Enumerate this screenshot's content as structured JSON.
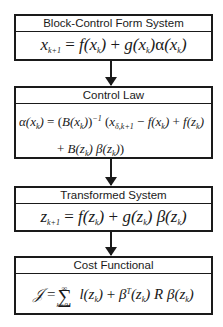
{
  "diagram": {
    "blocks": [
      {
        "title": "Block-Control Form System",
        "equation": {
          "lhs": "x",
          "lhs_sub": "k+1",
          "text": "= f(x_k) + g(x_k) α(x_k)"
        }
      },
      {
        "title": "Control Law",
        "equation": {
          "line1": "α(x_k) = (B(x_k))^{-1} (x_{δ,k+1} − f(x_k) + f(z_k)",
          "line2": "+ B(z_k) β(z_k))"
        }
      },
      {
        "title": "Transformed System",
        "equation": {
          "text": "z_{k+1} = f(z_k) + g(z_k) β(z_k)"
        }
      },
      {
        "title": "Cost Functional",
        "equation": {
          "text": "J = Σ_{k=0}^{∞} l(z_k) + β^T(z_k) R β(z_k)",
          "sum_upper": "∞",
          "sum_lower": "k=0"
        }
      }
    ],
    "arrows": [
      {
        "from": "Block-Control Form System",
        "to": "Control Law"
      },
      {
        "from": "Control Law",
        "to": "Transformed System"
      },
      {
        "from": "Transformed System",
        "to": "Cost Functional"
      }
    ],
    "colors": {
      "stroke": "#1a1a1a",
      "background": "#ffffff"
    }
  }
}
